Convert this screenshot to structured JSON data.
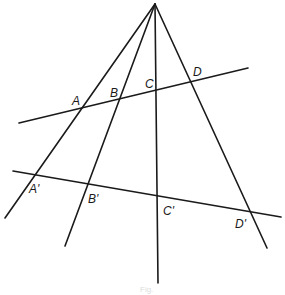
{
  "diagram": {
    "apex": {
      "x": 155,
      "y": 4
    },
    "rays": [
      {
        "id": "ray-a",
        "x1": 155,
        "y1": 4,
        "x2": 5,
        "y2": 218
      },
      {
        "id": "ray-b",
        "x1": 155,
        "y1": 4,
        "x2": 65,
        "y2": 246
      },
      {
        "id": "ray-c",
        "x1": 155,
        "y1": 4,
        "x2": 158,
        "y2": 283
      },
      {
        "id": "ray-d",
        "x1": 155,
        "y1": 4,
        "x2": 267,
        "y2": 248
      }
    ],
    "transversals": [
      {
        "id": "upper",
        "x1": 19,
        "y1": 123,
        "x2": 248,
        "y2": 68
      },
      {
        "id": "lower",
        "x1": 13,
        "y1": 171,
        "x2": 281,
        "y2": 217
      }
    ],
    "labels": {
      "A": "A",
      "B": "B",
      "C": "C",
      "D": "D",
      "A_prime": "A'",
      "B_prime": "B'",
      "C_prime": "C'",
      "D_prime": "D'"
    },
    "caption": "Fig."
  }
}
